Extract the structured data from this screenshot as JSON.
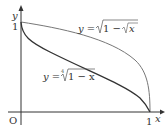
{
  "axes": {
    "x_label": "x",
    "y_label": "y",
    "origin_label": "O",
    "x_tick": "1",
    "y_tick": "1"
  },
  "curves": [
    {
      "name": "upper",
      "label": "y = √(1 − √x)",
      "label_parts": {
        "lhs": "y =",
        "rad": "1 − ",
        "inner": "x"
      },
      "color": "#777777"
    },
    {
      "name": "lower",
      "label": "y = ⁴√(1 − x)",
      "label_parts": {
        "lhs": "y =",
        "index": "4",
        "rad": "1 − x"
      },
      "color": "#333333"
    }
  ]
}
